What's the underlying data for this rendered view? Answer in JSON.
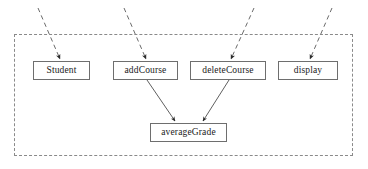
{
  "diagram": {
    "type": "uml-class-operation-dependency-diagram",
    "canvas": {
      "width": 368,
      "height": 169
    },
    "package_boundary": {
      "name": "package-boundary",
      "style": "dashed",
      "color": "#8a8a8a",
      "x": 14,
      "y": 34,
      "width": 339,
      "height": 122
    },
    "nodes": [
      {
        "id": "student",
        "label": "Student",
        "x": 33,
        "y": 61,
        "width": 57,
        "height": 19
      },
      {
        "id": "addCourse",
        "label": "addCourse",
        "x": 113,
        "y": 61,
        "width": 65,
        "height": 19
      },
      {
        "id": "deleteCourse",
        "label": "deleteCourse",
        "x": 190,
        "y": 61,
        "width": 76,
        "height": 19
      },
      {
        "id": "display",
        "label": "display",
        "x": 278,
        "y": 61,
        "width": 60,
        "height": 19
      },
      {
        "id": "averageGrade",
        "label": "averageGrade",
        "x": 150,
        "y": 123,
        "width": 77,
        "height": 19
      }
    ],
    "edges": [
      {
        "id": "e1",
        "from": "external-top-1",
        "to": "student",
        "style": "dashed",
        "arrow": "filled",
        "x1": 38,
        "y1": 8,
        "x2": 60,
        "y2": 59
      },
      {
        "id": "e2",
        "from": "external-top-2",
        "to": "addCourse",
        "style": "dashed",
        "arrow": "filled",
        "x1": 124,
        "y1": 8,
        "x2": 146,
        "y2": 59
      },
      {
        "id": "e3",
        "from": "external-top-3",
        "to": "deleteCourse",
        "style": "dashed",
        "arrow": "filled",
        "x1": 254,
        "y1": 8,
        "x2": 231,
        "y2": 59
      },
      {
        "id": "e4",
        "from": "external-top-4",
        "to": "display",
        "style": "dashed",
        "arrow": "filled",
        "x1": 332,
        "y1": 8,
        "x2": 310,
        "y2": 59
      },
      {
        "id": "e5",
        "from": "addCourse",
        "to": "averageGrade",
        "style": "solid",
        "arrow": "filled",
        "x1": 147,
        "y1": 80,
        "x2": 175,
        "y2": 121
      },
      {
        "id": "e6",
        "from": "deleteCourse",
        "to": "averageGrade",
        "style": "solid",
        "arrow": "filled",
        "x1": 229,
        "y1": 80,
        "x2": 203,
        "y2": 121
      }
    ],
    "colors": {
      "node_border": "#6e6e6e",
      "node_fill": "#ffffff",
      "edge": "#4d4d4d",
      "dashed_edge": "#6b6b6b",
      "boundary": "#8a8a8a",
      "text": "#1a1a1a",
      "background": "#ffffff"
    }
  }
}
